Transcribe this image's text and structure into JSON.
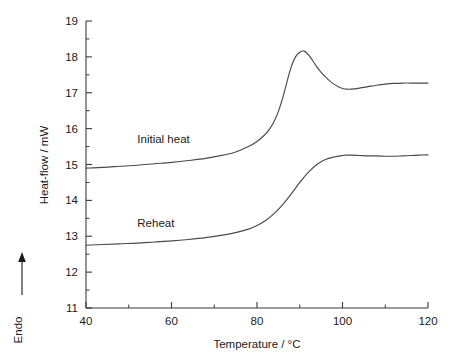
{
  "chart_data": {
    "type": "line",
    "title": "",
    "xlabel": "Temperature / °C",
    "ylabel": "Heat-flow / mW",
    "xlim": [
      40,
      120
    ],
    "ylim": [
      11,
      19
    ],
    "xticks": [
      40,
      60,
      80,
      100,
      120
    ],
    "xticklabels": [
      "40",
      "60",
      "80",
      "100",
      "120"
    ],
    "xminorticks": [
      50,
      70,
      90,
      110
    ],
    "yticks": [
      11,
      12,
      13,
      14,
      15,
      16,
      17,
      18,
      19
    ],
    "yticklabels": [
      "11",
      "12",
      "13",
      "14",
      "15",
      "16",
      "17",
      "18",
      "19"
    ],
    "grid": false,
    "legend_position": "inline-annotation",
    "axis_style": "open-left-bottom",
    "secondary_axis_label": "Endo",
    "secondary_axis_arrow": "up",
    "series": [
      {
        "name": "Initial heat",
        "label_x": 52,
        "label_y": 15.6,
        "x": [
          40,
          44,
          48,
          52,
          56,
          60,
          64,
          68,
          72,
          75,
          78,
          80,
          82,
          83,
          84,
          85,
          86,
          87,
          88,
          89,
          90,
          91,
          92,
          93,
          94,
          95,
          96,
          97,
          98,
          99,
          100,
          101,
          102,
          104,
          106,
          108,
          110,
          112,
          114,
          116,
          118,
          120
        ],
        "y": [
          14.9,
          14.92,
          14.95,
          14.98,
          15.02,
          15.06,
          15.11,
          15.17,
          15.26,
          15.35,
          15.5,
          15.64,
          15.85,
          16.0,
          16.2,
          16.48,
          16.85,
          17.3,
          17.72,
          18.0,
          18.13,
          18.16,
          18.06,
          17.9,
          17.72,
          17.57,
          17.44,
          17.33,
          17.24,
          17.17,
          17.12,
          17.1,
          17.1,
          17.13,
          17.17,
          17.21,
          17.24,
          17.26,
          17.27,
          17.27,
          17.27,
          17.27
        ]
      },
      {
        "name": "Reheat",
        "label_x": 52,
        "label_y": 13.25,
        "x": [
          40,
          44,
          48,
          52,
          56,
          60,
          64,
          68,
          72,
          75,
          78,
          80,
          82,
          84,
          86,
          88,
          90,
          92,
          94,
          96,
          98,
          100,
          101,
          102,
          104,
          106,
          108,
          110,
          112,
          114,
          116,
          118,
          120
        ],
        "y": [
          12.75,
          12.77,
          12.79,
          12.81,
          12.84,
          12.87,
          12.91,
          12.96,
          13.03,
          13.1,
          13.2,
          13.3,
          13.44,
          13.63,
          13.88,
          14.18,
          14.5,
          14.78,
          15.0,
          15.14,
          15.21,
          15.25,
          15.26,
          15.26,
          15.25,
          15.24,
          15.24,
          15.23,
          15.23,
          15.24,
          15.25,
          15.26,
          15.27
        ]
      }
    ]
  }
}
